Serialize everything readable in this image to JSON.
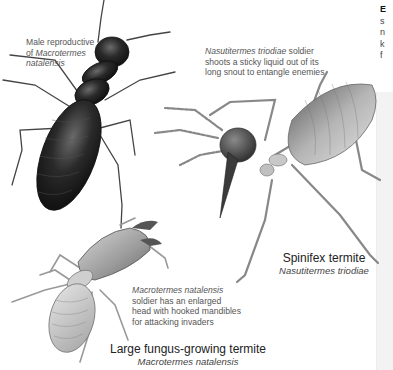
{
  "page": {
    "background": "#ffffff"
  },
  "side_column": {
    "heading_fragment": "E",
    "line_fragments": [
      "s",
      "n",
      "k",
      "f"
    ]
  },
  "illustrations": [
    {
      "id": "male-reproductive",
      "caption": {
        "line1": "Male reproductive",
        "line2_prefix": "of ",
        "line2_italic": "Macrotermes",
        "line3_italic": "natalensis"
      },
      "color": "#1c1c1c"
    },
    {
      "id": "spinifex-soldier",
      "caption": {
        "line1_italic": "Nasutitermes triodiae",
        "line1_rest": " soldier",
        "line2": "shoots a sticky liquid out of its",
        "line3": "long snout to entangle enemies"
      },
      "label": {
        "common_name": "Spinifex termite",
        "scientific_name": "Nasutitermes triodiae"
      },
      "color": "#8a8a8a"
    },
    {
      "id": "fungus-soldier",
      "caption": {
        "line1_italic": "Macrotermes natalensis",
        "line2": "soldier has an enlarged",
        "line3": "head with hooked mandibles",
        "line4": "for attacking invaders"
      },
      "label": {
        "common_name": "Large fungus-growing termite",
        "scientific_name": "Macrotermes natalensis"
      },
      "color": "#b0b0b0"
    }
  ]
}
